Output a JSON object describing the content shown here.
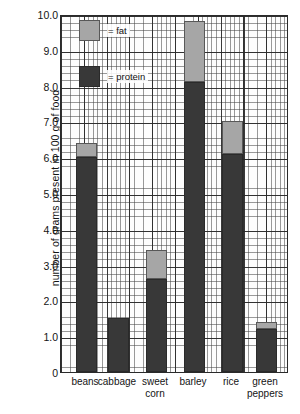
{
  "chart_data": {
    "type": "bar",
    "subtype": "stacked-bar",
    "title": "",
    "xlabel": "",
    "ylabel": "number of grams present in 100 g of food",
    "ylim": [
      0,
      10.0
    ],
    "ytick_labels": [
      "0",
      "1.0",
      "2.0",
      "3.0",
      "4.0",
      "5.0",
      "6.0",
      "7.0",
      "8.0",
      "9.0",
      "10.0"
    ],
    "ytick_values": [
      0,
      1.0,
      2.0,
      3.0,
      4.0,
      5.0,
      6.0,
      7.0,
      8.0,
      9.0,
      10.0
    ],
    "grid": "graph-paper, major gridlines every 1.0 g, minor gridlines every 0.2 g",
    "legend_position": "top-left inside plot",
    "categories": [
      "beans",
      "cabbage",
      "sweet\ncorn",
      "barley",
      "rice",
      "green\npeppers"
    ],
    "category_labels_flat": [
      "beans",
      "cabbage",
      "sweet corn",
      "barley",
      "rice",
      "green peppers"
    ],
    "series": [
      {
        "name": "protein",
        "legend_label": "= protein",
        "color": "#383838",
        "values": [
          6.0,
          1.5,
          2.6,
          8.1,
          6.1,
          1.2
        ]
      },
      {
        "name": "fat",
        "legend_label": "= fat",
        "color": "#a6a6a6",
        "values": [
          0.4,
          0.0,
          0.8,
          1.7,
          0.9,
          0.2
        ]
      }
    ],
    "stack_totals": [
      6.4,
      1.5,
      3.4,
      9.8,
      7.0,
      1.4
    ]
  },
  "legend": {
    "entries": [
      {
        "label": "= fat",
        "swatch": "fat"
      },
      {
        "label": "= protein",
        "swatch": "protein"
      }
    ]
  },
  "axes": {
    "y_title": "number of grams present in 100 g of food"
  },
  "colors": {
    "protein": "#383838",
    "fat": "#a6a6a6",
    "grid_major": "#282828",
    "grid_minor": "#464646",
    "axis": "#2a2a2a",
    "text": "#141414",
    "background": "#ffffff"
  }
}
